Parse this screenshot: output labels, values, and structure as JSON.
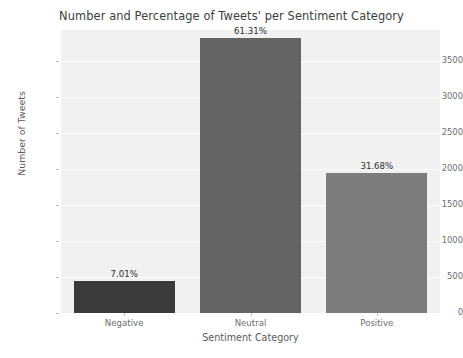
{
  "chart_data": {
    "type": "bar",
    "title": "Number and Percentage of Tweets' per Sentiment Category",
    "xlabel": "Sentiment Category",
    "ylabel": "Number of Tweets",
    "categories": [
      "Negative",
      "Neutral",
      "Positive"
    ],
    "values": [
      440,
      3825,
      1950
    ],
    "data_labels": [
      "7.01%",
      "61.31%",
      "31.68%"
    ],
    "percentages": [
      7.01,
      61.31,
      31.68
    ],
    "ylim": [
      0,
      3930
    ],
    "yticks": [
      0,
      500,
      1000,
      1500,
      2000,
      2500,
      3000,
      3500
    ],
    "ytick_labels": [
      "0",
      "500",
      "1000",
      "1500",
      "2000",
      "2500",
      "3000",
      "3500"
    ],
    "grid": true,
    "legend": false,
    "bar_colors": [
      "#3a3a3a",
      "#646464",
      "#7d7d7d"
    ],
    "plot_background": "#f1f1f1",
    "gridline_color": "#fdfdfd",
    "figure_background": "#ffffff"
  }
}
